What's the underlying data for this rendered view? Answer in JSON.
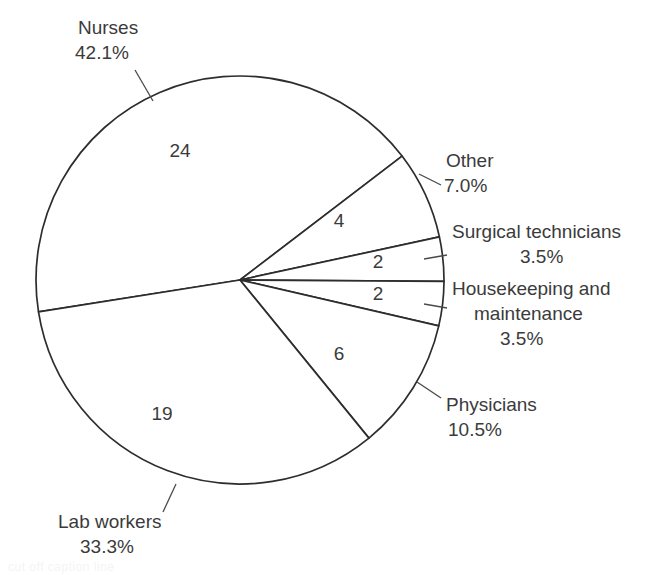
{
  "chart_data": {
    "type": "pie",
    "title": "",
    "subtitle": "",
    "xlabel": "",
    "ylabel": "",
    "legend_position": "callout-labels",
    "grid": false,
    "total": 57,
    "units": "workers",
    "categories": [
      "Nurses",
      "Other",
      "Surgical technicians",
      "Housekeeping and maintenance",
      "Physicians",
      "Lab workers"
    ],
    "values": [
      24,
      4,
      2,
      2,
      6,
      19
    ],
    "percent_labels": [
      "42.1%",
      "7.0%",
      "3.5%",
      "3.5%",
      "10.5%",
      "33.3%"
    ],
    "percents": [
      42.1,
      7.0,
      3.5,
      3.5,
      10.5,
      33.3
    ],
    "slices": [
      {
        "name": "Nurses",
        "percent_label": "42.1%",
        "percent": 42.1,
        "count": "24",
        "value": 24,
        "start_angle": 171,
        "end_angle": 322.6,
        "count_x": 180,
        "count_y": 157,
        "label_x": 78,
        "label_name_y": 34,
        "label_pct_y": 59,
        "label_anchor": "start",
        "leader_x1": 135,
        "leader_y1": 70,
        "leader_x2": 153,
        "leader_y2": 101
      },
      {
        "name": "Other",
        "percent_label": "7.0%",
        "percent": 7.0,
        "count": "4",
        "value": 4,
        "start_angle": 322.6,
        "end_angle": 347.8,
        "count_x": 339,
        "count_y": 227,
        "label_x": 446,
        "label_name_y": 167,
        "label_pct_y": 192,
        "label_anchor": "start",
        "leader_x1": 441,
        "leader_y1": 185,
        "leader_x2": 419,
        "leader_y2": 174
      },
      {
        "name": "Surgical technicians",
        "percent_label": "3.5%",
        "percent": 3.5,
        "count": "2",
        "value": 2,
        "start_angle": 347.8,
        "end_angle": 360.4,
        "count_x": 378,
        "count_y": 268,
        "label_x": 452,
        "label_name_y": 238,
        "label_pct_y": 263,
        "label_anchor": "start",
        "leader_x1": 447,
        "leader_y1": 255,
        "leader_x2": 424,
        "leader_y2": 259
      },
      {
        "name": "Housekeeping and maintenance",
        "percent_label": "3.5%",
        "percent": 3.5,
        "count": "2",
        "value": 2,
        "start_angle": 0.4,
        "end_angle": 13,
        "count_x": 378,
        "count_y": 300,
        "label_line1": "Housekeeping and",
        "label_line2": "maintenance",
        "label_x": 452,
        "label_name_y": 295,
        "label_name2_y": 320,
        "label_pct_y": 345,
        "label_anchor": "start",
        "leader_x1": 447,
        "leader_y1": 308,
        "leader_x2": 424,
        "leader_y2": 304
      },
      {
        "name": "Physicians",
        "percent_label": "10.5%",
        "percent": 10.5,
        "count": "6",
        "value": 6,
        "start_angle": 13,
        "end_angle": 50.8,
        "count_x": 339,
        "count_y": 360,
        "label_x": 446,
        "label_name_y": 411,
        "label_pct_y": 436,
        "label_anchor": "start",
        "leader_x1": 441,
        "leader_y1": 398,
        "leader_x2": 417,
        "leader_y2": 382
      },
      {
        "name": "Lab workers",
        "percent_label": "33.3%",
        "percent": 33.3,
        "count": "19",
        "value": 19,
        "start_angle": 50.8,
        "end_angle": 171,
        "count_x": 162,
        "count_y": 420,
        "label_x": 58,
        "label_name_y": 528,
        "label_pct_y": 553,
        "label_anchor": "start",
        "leader_x1": 163,
        "leader_y1": 512,
        "leader_x2": 176,
        "leader_y2": 484
      }
    ],
    "geometry": {
      "center_x": 240,
      "center_y": 280,
      "radius": 204
    },
    "colors": {
      "slice_fill": "#ffffff",
      "slice_stroke": "#2d2d2d",
      "text": "#3b3b3b",
      "leader": "#4a4a4a",
      "background": "#ffffff"
    }
  },
  "caption": {
    "ghost_text": "cut off caption line"
  }
}
